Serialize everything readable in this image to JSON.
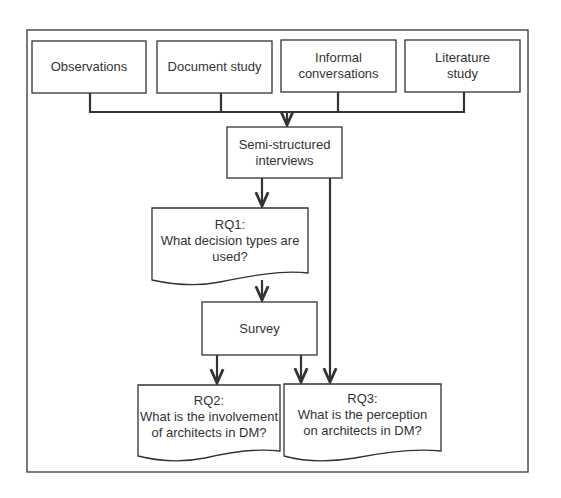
{
  "diagram": {
    "type": "flowchart",
    "colors": {
      "stroke": "#333333",
      "background": "#ffffff",
      "text": "#333333"
    },
    "sources": [
      {
        "id": "observations",
        "lines": [
          "Observations"
        ]
      },
      {
        "id": "document-study",
        "lines": [
          "Document study"
        ]
      },
      {
        "id": "informal-conversations",
        "lines": [
          "Informal",
          "conversations"
        ]
      },
      {
        "id": "literature-study",
        "lines": [
          "Literature",
          "study"
        ]
      }
    ],
    "interviews": {
      "lines": [
        "Semi-structured",
        "interviews"
      ]
    },
    "rq1": {
      "lines": [
        "RQ1:",
        "What decision types are",
        "used?"
      ]
    },
    "survey": {
      "lines": [
        "Survey"
      ]
    },
    "rq2": {
      "lines": [
        "RQ2:",
        "What is the involvement",
        "of architects in DM?"
      ]
    },
    "rq3": {
      "lines": [
        "RQ3:",
        "What is the perception",
        "on architects in DM?"
      ]
    },
    "edges": [
      {
        "from": "observations",
        "to": "semi-structured-interviews"
      },
      {
        "from": "document-study",
        "to": "semi-structured-interviews"
      },
      {
        "from": "informal-conversations",
        "to": "semi-structured-interviews"
      },
      {
        "from": "literature-study",
        "to": "semi-structured-interviews"
      },
      {
        "from": "semi-structured-interviews",
        "to": "rq1"
      },
      {
        "from": "semi-structured-interviews",
        "to": "rq3"
      },
      {
        "from": "rq1",
        "to": "survey"
      },
      {
        "from": "survey",
        "to": "rq2"
      },
      {
        "from": "survey",
        "to": "rq3"
      }
    ]
  }
}
